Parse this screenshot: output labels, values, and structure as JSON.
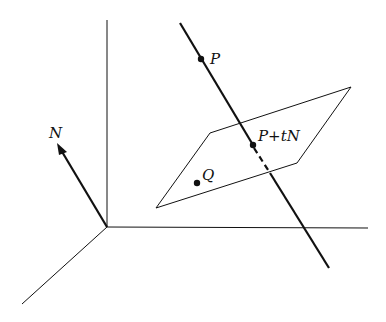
{
  "diagram": {
    "labels": {
      "normal": "N",
      "point_p": "P",
      "point_projection": "P+tN",
      "point_q": "Q"
    },
    "colors": {
      "stroke": "#111111",
      "background": "#ffffff"
    },
    "elements": {
      "axes": [
        "vertical-axis",
        "horizontal-axis",
        "depth-axis"
      ],
      "normal_vector": "arrow from origin labeled N",
      "line": "line through P in direction N, dashed behind plane",
      "plane": "parallelogram containing Q and P+tN"
    }
  }
}
